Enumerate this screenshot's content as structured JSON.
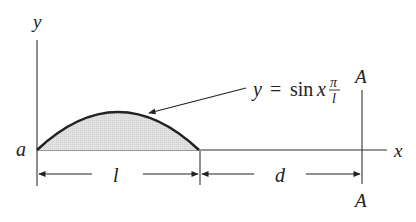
{
  "diagram": {
    "type": "beam-load-diagram",
    "axes": {
      "y_label": "y",
      "x_label": "x",
      "origin_label": "a"
    },
    "curve": {
      "equation_lhs": "y",
      "equation_eq": "=",
      "equation_fn": "sin",
      "equation_var": "x",
      "fraction_num": "π",
      "fraction_den": "l",
      "fill_color": "#d8d8d8",
      "stroke_color": "#222222"
    },
    "section_line": {
      "top_label": "A",
      "bottom_label": "A"
    },
    "dimensions": {
      "length_label": "l",
      "distance_label": "d"
    }
  }
}
